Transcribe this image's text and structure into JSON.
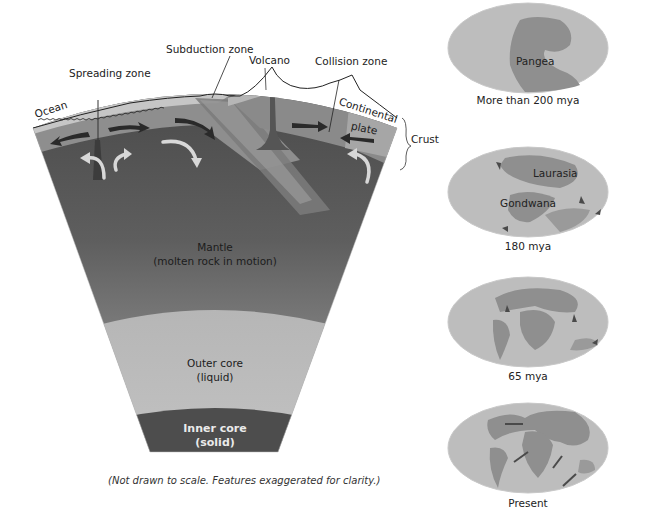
{
  "diagram": {
    "cross_section": {
      "labels": {
        "ocean": "Ocean",
        "spreading_zone": "Spreading zone",
        "subduction_zone": "Subduction zone",
        "volcano": "Volcano",
        "collision_zone": "Collision zone",
        "continental_plate_line1": "Continental",
        "continental_plate_line2": "plate",
        "crust": "Crust"
      },
      "layers": {
        "mantle_line1": "Mantle",
        "mantle_line2": "(molten rock in motion)",
        "outer_core_line1": "Outer core",
        "outer_core_line2": "(liquid)",
        "inner_core_line1": "Inner core",
        "inner_core_line2": "(solid)"
      },
      "caption": "(Not drawn to scale. Features exaggerated for clarity.)",
      "colors": {
        "mantle_top": "#4a4a4a",
        "mantle_bottom": "#9a9a9a",
        "outer_core": "#b8b8b8",
        "inner_core": "#4d4d4d",
        "crust_oceanic": "#8a8a8a",
        "crust_light": "#c4c4c4",
        "continental": "#a9a9a9"
      }
    },
    "globes": [
      {
        "caption": "More than 200 mya",
        "labels": [
          "Pangea"
        ]
      },
      {
        "caption": "180 mya",
        "labels": [
          "Laurasia",
          "Gondwana"
        ]
      },
      {
        "caption": "65 mya",
        "labels": []
      },
      {
        "caption": "Present",
        "labels": []
      }
    ]
  }
}
